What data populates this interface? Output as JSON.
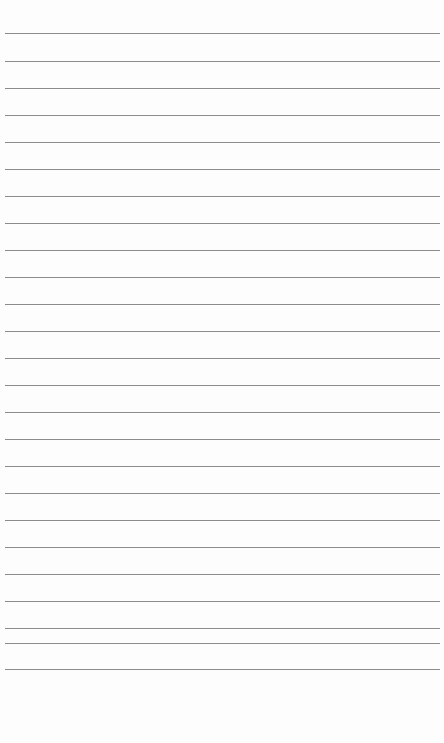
{
  "paper": {
    "type": "lined-paper",
    "background_color": "#fdfdfd",
    "line_color": "#8c8c8c",
    "line_count": 25,
    "line_positions_y": [
      33,
      61,
      88,
      115,
      142,
      169,
      196,
      223,
      250,
      277,
      304,
      331,
      358,
      385,
      412,
      439,
      466,
      493,
      520,
      547,
      574,
      601,
      628,
      643,
      669
    ]
  }
}
